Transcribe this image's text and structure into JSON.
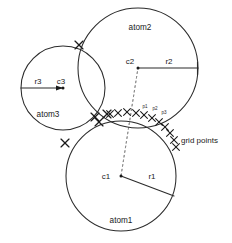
{
  "figure": {
    "background_color": "#ffffff",
    "stroke_color": "#2b2b2b",
    "dashed_color": "#8a8a8a",
    "width": 232,
    "height": 243
  },
  "atoms": [
    {
      "id": "atom1",
      "name_label": "atom1",
      "center_label": "c1",
      "radius_label": "r1",
      "cx": 121,
      "cy": 176,
      "r": 55,
      "name_label_x": 121,
      "name_label_y": 223,
      "center_label_x": 106,
      "center_label_y": 179,
      "radius_label_x": 152,
      "radius_label_y": 179,
      "radius_end_x": 174,
      "radius_end_y": 196
    },
    {
      "id": "atom2",
      "name_label": "atom2",
      "center_label": "c2",
      "radius_label": "r2",
      "cx": 138,
      "cy": 68,
      "r": 60,
      "name_label_x": 140,
      "name_label_y": 30,
      "center_label_x": 130,
      "center_label_y": 64,
      "radius_label_x": 169,
      "radius_label_y": 64,
      "radius_end_x": 198,
      "radius_end_y": 68
    },
    {
      "id": "atom3",
      "name_label": "atom3",
      "center_label": "c3",
      "radius_label": "r3",
      "cx": 63,
      "cy": 88,
      "r": 42,
      "name_label_x": 48,
      "name_label_y": 117,
      "center_label_x": 61,
      "center_label_y": 84,
      "radius_label_x": 38,
      "radius_label_y": 84,
      "radius_end_x": 21,
      "radius_end_y": 88
    }
  ],
  "intersection_marks": [
    {
      "name": "atom2-atom3-upper",
      "x": 79,
      "y": 45
    },
    {
      "name": "atom1-atom3-lower",
      "x": 65,
      "y": 143
    },
    {
      "name": "triple-point-left",
      "x": 95,
      "y": 117
    },
    {
      "name": "triple-point-right",
      "x": 107,
      "y": 114
    },
    {
      "name": "triple-point-mid",
      "x": 99,
      "y": 122
    }
  ],
  "grid_points": {
    "label": "grid points",
    "label_x": 181,
    "label_y": 143,
    "marks": [
      {
        "x": 110,
        "y": 114
      },
      {
        "x": 118,
        "y": 113
      },
      {
        "x": 127,
        "y": 112
      },
      {
        "x": 136,
        "y": 113
      },
      {
        "x": 144,
        "y": 115
      },
      {
        "x": 152,
        "y": 118
      },
      {
        "x": 159,
        "y": 122
      },
      {
        "x": 165,
        "y": 127
      },
      {
        "x": 170,
        "y": 133
      },
      {
        "x": 174,
        "y": 140
      },
      {
        "x": 176,
        "y": 147
      }
    ],
    "point_labels": [
      {
        "text": "p1",
        "x": 145,
        "y": 108
      },
      {
        "text": "p2",
        "x": 155,
        "y": 110
      },
      {
        "text": "p3",
        "x": 164,
        "y": 114
      }
    ]
  },
  "connector": {
    "name": "c1-to-c2-dashed-line",
    "from_x": 121,
    "from_y": 176,
    "to_x": 138,
    "to_y": 68
  }
}
